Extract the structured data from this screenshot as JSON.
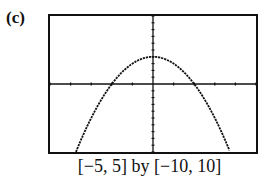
{
  "figure_label": "(c)",
  "caption": "[−5, 5] by [−10, 10]",
  "chart_data": {
    "type": "line",
    "title": "",
    "function": "y = 4 - x^2",
    "xlabel": "",
    "ylabel": "",
    "xlim": [
      -5,
      5
    ],
    "ylim": [
      -10,
      10
    ],
    "xscale_tick": 1,
    "yscale_tick": 1,
    "grid": false,
    "legend": null,
    "x": [
      -3.7,
      -3,
      -2,
      -1,
      0,
      1,
      2,
      3,
      3.7
    ],
    "series": [
      {
        "name": "curve",
        "values": [
          -9.69,
          -5,
          0,
          3,
          4,
          3,
          0,
          -5,
          -9.69
        ]
      }
    ],
    "annotations": [
      "[−5, 5] by [−10, 10]"
    ]
  }
}
